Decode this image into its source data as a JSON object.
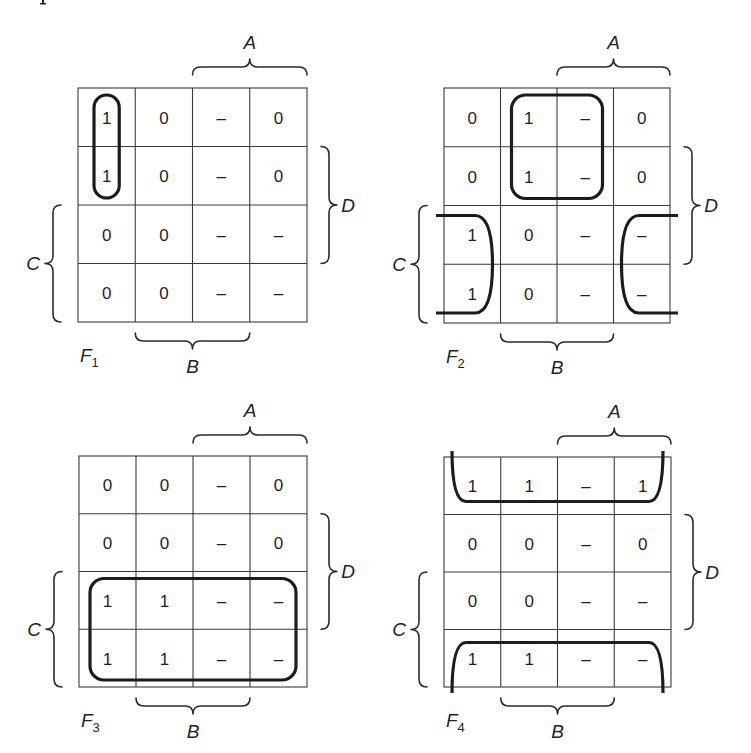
{
  "figure": {
    "top_fragment": "ı",
    "maps": [
      {
        "id": "F1",
        "name": "F",
        "subscript": "1",
        "grid": {
          "x": 78,
          "y": 88,
          "w": 229,
          "h": 234
        },
        "cells": [
          [
            "1",
            "0",
            "–",
            "0"
          ],
          [
            "1",
            "0",
            "–",
            "0"
          ],
          [
            "0",
            "0",
            "–",
            "–"
          ],
          [
            "0",
            "0",
            "–",
            "–"
          ]
        ],
        "labels": {
          "A": "A",
          "B": "B",
          "C": "C",
          "D": "D"
        },
        "groups": [
          {
            "type": "rect",
            "col": 0,
            "row": 0,
            "cols": 1,
            "rows": 2,
            "desc": "vertical pair column 1 rows 1-2"
          }
        ]
      },
      {
        "id": "F2",
        "name": "F",
        "subscript": "2",
        "grid": {
          "x": 444,
          "y": 88,
          "w": 226,
          "h": 235
        },
        "cells": [
          [
            "0",
            "1",
            "–",
            "0"
          ],
          [
            "0",
            "1",
            "–",
            "0"
          ],
          [
            "1",
            "0",
            "–",
            "–"
          ],
          [
            "1",
            "0",
            "–",
            "–"
          ]
        ],
        "labels": {
          "A": "A",
          "B": "B",
          "C": "C",
          "D": "D"
        },
        "groups": [
          {
            "type": "rect",
            "col": 1,
            "row": 0,
            "cols": 2,
            "rows": 2,
            "desc": "2x2 square"
          },
          {
            "type": "wrap-lr",
            "row": 2,
            "rows": 2,
            "desc": "wrap-around left/right columns rows 3-4"
          }
        ]
      },
      {
        "id": "F3",
        "name": "F",
        "subscript": "3",
        "grid": {
          "x": 79,
          "y": 456,
          "w": 228,
          "h": 231
        },
        "cells": [
          [
            "0",
            "0",
            "–",
            "0"
          ],
          [
            "0",
            "0",
            "–",
            "0"
          ],
          [
            "1",
            "1",
            "–",
            "–"
          ],
          [
            "1",
            "1",
            "–",
            "–"
          ]
        ],
        "labels": {
          "A": "A",
          "B": "B",
          "C": "C",
          "D": "D"
        },
        "groups": [
          {
            "type": "rect",
            "col": 0,
            "row": 2,
            "cols": 4,
            "rows": 2,
            "desc": "bottom two rows"
          }
        ]
      },
      {
        "id": "F4",
        "name": "F",
        "subscript": "4",
        "grid": {
          "x": 444,
          "y": 457,
          "w": 227,
          "h": 230
        },
        "cells": [
          [
            "1",
            "1",
            "–",
            "1"
          ],
          [
            "0",
            "0",
            "–",
            "0"
          ],
          [
            "0",
            "0",
            "–",
            "–"
          ],
          [
            "1",
            "1",
            "–",
            "–"
          ]
        ],
        "labels": {
          "A": "A",
          "B": "B",
          "C": "C",
          "D": "D"
        },
        "groups": [
          {
            "type": "wrap-tb",
            "desc": "wrap-around top and bottom rows"
          }
        ]
      }
    ]
  }
}
